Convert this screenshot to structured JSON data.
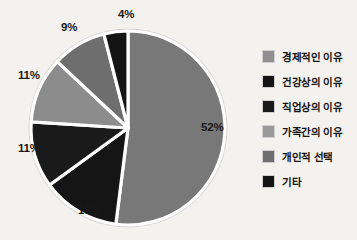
{
  "chart_data": {
    "type": "pie",
    "title": "",
    "subtitle": "",
    "xlabel": "",
    "ylabel": "",
    "grid": false,
    "legend_position": "right",
    "start_angle_deg": 0,
    "direction": "clockwise",
    "categories": [
      "경제적인 이유",
      "건강상의 이유",
      "직업상의 이유",
      "가족간의 이유",
      "개인적 선택",
      "기타"
    ],
    "values": [
      52,
      13,
      11,
      11,
      9,
      4
    ],
    "value_labels": [
      "52%",
      "13%",
      "11%",
      "11%",
      "9%",
      "4%"
    ],
    "colors": [
      "#787878",
      "#151515",
      "#1a1a1a",
      "#8c8c8c",
      "#6e6e6e",
      "#141414"
    ],
    "slices": [
      {
        "label": "경제적인 이유",
        "value": 52,
        "value_label": "52%",
        "color": "#787878"
      },
      {
        "label": "건강상의 이유",
        "value": 13,
        "value_label": "13%",
        "color": "#151515"
      },
      {
        "label": "직업상의 이유",
        "value": 11,
        "value_label": "11%",
        "color": "#1a1a1a"
      },
      {
        "label": "가족간의 이유",
        "value": 11,
        "value_label": "11%",
        "color": "#8c8c8c"
      },
      {
        "label": "개인적 선택",
        "value": 9,
        "value_label": "9%",
        "color": "#6e6e6e"
      },
      {
        "label": "기타",
        "value": 4,
        "value_label": "4%",
        "color": "#141414"
      }
    ]
  },
  "labels": {
    "pct_52": "52%",
    "pct_13": "13%",
    "pct_11_lower": "11%",
    "pct_11_upper": "11%",
    "pct_9": "9%",
    "pct_4": "4%"
  },
  "legend": {
    "items": [
      {
        "label": "경제적인 이유",
        "color": "#8f8f8f"
      },
      {
        "label": "건강상의 이유",
        "color": "#151515"
      },
      {
        "label": "직업상의 이유",
        "color": "#1a1a1a"
      },
      {
        "label": "가족간의 이유",
        "color": "#9a9a9a"
      },
      {
        "label": "개인적 선택",
        "color": "#6e6e6e"
      },
      {
        "label": "기타",
        "color": "#141414"
      }
    ]
  },
  "style": {
    "background": "#f4f2ee",
    "separator": "#ffffff",
    "rim": "#d8d6d2"
  }
}
